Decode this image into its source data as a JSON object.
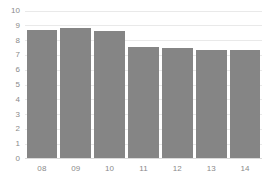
{
  "chart_data": {
    "type": "bar",
    "title": "",
    "subtitle": "",
    "xlabel": "",
    "ylabel": "",
    "categories": [
      "08",
      "09",
      "10",
      "11",
      "12",
      "13",
      "14"
    ],
    "values": [
      8.65,
      8.8,
      8.55,
      7.5,
      7.4,
      7.3,
      7.3
    ],
    "series": [
      {
        "name": "",
        "values": [
          8.65,
          8.8,
          8.55,
          7.5,
          7.4,
          7.3,
          7.3
        ]
      }
    ],
    "ylim": [
      0,
      10
    ],
    "xlim": null,
    "y_ticks": [
      0,
      1,
      2,
      3,
      4,
      5,
      6,
      7,
      8,
      9,
      10
    ],
    "y_tick_labels": [
      "0",
      "1",
      "2",
      "3",
      "4",
      "5",
      "6",
      "7",
      "8",
      "9",
      "10"
    ],
    "x_tick_labels": [
      "08",
      "09",
      "10",
      "11",
      "12",
      "13",
      "14"
    ],
    "grid": true,
    "grid_axis": "y",
    "legend": false,
    "legend_position": "none",
    "annotations": [],
    "colors": {
      "bar": "#858585",
      "gridline": "#e9e9e9",
      "baseline": "#dadada",
      "tick_label": "#8a8a8a",
      "background": "#ffffff"
    }
  }
}
